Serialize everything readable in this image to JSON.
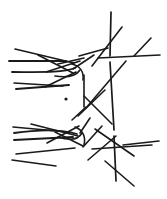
{
  "figure": {
    "canvas": {
      "width": 167,
      "height": 199,
      "background": "#ffffff"
    },
    "ink_color": "#1a1a1a",
    "default_stroke_width": 1.6
  },
  "chart_data": {
    "type": "scatter",
    "xlabel": "",
    "ylabel": "",
    "xlim": [
      0,
      167
    ],
    "ylim": [
      0,
      199
    ],
    "grid": false,
    "legend": "none",
    "annotations": [
      {
        "name": "isolated-dot",
        "x": 66,
        "y": 99,
        "radius": 1.6
      }
    ],
    "segments": [
      {
        "id": "s01",
        "group": "upper-left-fan",
        "x1": 15,
        "y1": 49,
        "x2": 74,
        "y2": 63,
        "width": 1.6
      },
      {
        "id": "s02",
        "group": "upper-left-fan",
        "x1": 9,
        "y1": 61,
        "x2": 66,
        "y2": 61,
        "width": 1.9
      },
      {
        "id": "s03",
        "group": "upper-left-fan",
        "x1": 38,
        "y1": 55,
        "x2": 73,
        "y2": 73,
        "width": 1.6
      },
      {
        "id": "s04",
        "group": "upper-left-fan",
        "x1": 46,
        "y1": 72,
        "x2": 80,
        "y2": 61,
        "width": 1.6
      },
      {
        "id": "s05",
        "group": "upper-left-fan",
        "x1": 58,
        "y1": 64,
        "x2": 84,
        "y2": 58,
        "width": 1.6
      },
      {
        "id": "s06",
        "group": "upper-left-fan",
        "x1": 14,
        "y1": 83,
        "x2": 63,
        "y2": 86,
        "width": 1.6
      },
      {
        "id": "s07",
        "group": "upper-left-fan",
        "x1": 16,
        "y1": 89,
        "x2": 69,
        "y2": 85,
        "width": 1.9
      },
      {
        "id": "s08",
        "group": "upper-left-fan",
        "x1": 45,
        "y1": 87,
        "x2": 76,
        "y2": 72,
        "width": 1.6
      },
      {
        "id": "s09",
        "group": "upper-mid",
        "x1": 73,
        "y1": 69,
        "x2": 94,
        "y2": 55,
        "width": 1.6
      },
      {
        "id": "s10",
        "group": "upper-mid",
        "x1": 79,
        "y1": 56,
        "x2": 108,
        "y2": 48,
        "width": 1.6
      },
      {
        "id": "s11",
        "group": "upper-mid",
        "x1": 84,
        "y1": 75,
        "x2": 84,
        "y2": 107,
        "width": 1.6
      },
      {
        "id": "s12",
        "group": "right-vertical",
        "x1": 111,
        "y1": 12,
        "x2": 110,
        "y2": 56,
        "width": 1.7
      },
      {
        "id": "s13",
        "group": "right-vertical",
        "x1": 110,
        "y1": 62,
        "x2": 114,
        "y2": 130,
        "width": 1.7
      },
      {
        "id": "s14",
        "group": "right-vertical",
        "x1": 114,
        "y1": 136,
        "x2": 116,
        "y2": 181,
        "width": 1.7
      },
      {
        "id": "s15",
        "group": "upper-right-diag",
        "x1": 92,
        "y1": 66,
        "x2": 122,
        "y2": 27,
        "width": 1.6
      },
      {
        "id": "s16",
        "group": "upper-right-diag",
        "x1": 134,
        "y1": 56,
        "x2": 151,
        "y2": 38,
        "width": 1.6
      },
      {
        "id": "s17",
        "group": "upper-right-horiz",
        "x1": 98,
        "y1": 58,
        "x2": 160,
        "y2": 55,
        "width": 1.6
      },
      {
        "id": "s18",
        "group": "centre-diag",
        "x1": 86,
        "y1": 108,
        "x2": 126,
        "y2": 61,
        "width": 1.6
      },
      {
        "id": "s19",
        "group": "centre-diag",
        "x1": 78,
        "y1": 116,
        "x2": 105,
        "y2": 90,
        "width": 1.6
      },
      {
        "id": "s20",
        "group": "centre-diag",
        "x1": 84,
        "y1": 96,
        "x2": 112,
        "y2": 124,
        "width": 1.6
      },
      {
        "id": "s21",
        "group": "lower-left-fan",
        "x1": 13,
        "y1": 127,
        "x2": 68,
        "y2": 132,
        "width": 1.6
      },
      {
        "id": "s22",
        "group": "lower-left-fan",
        "x1": 31,
        "y1": 124,
        "x2": 78,
        "y2": 136,
        "width": 1.6
      },
      {
        "id": "s23",
        "group": "lower-left-fan",
        "x1": 14,
        "y1": 140,
        "x2": 73,
        "y2": 137,
        "width": 1.9
      },
      {
        "id": "s24",
        "group": "lower-left-fan",
        "x1": 47,
        "y1": 143,
        "x2": 79,
        "y2": 126,
        "width": 1.6
      },
      {
        "id": "s25",
        "group": "lower-left-fan",
        "x1": 55,
        "y1": 132,
        "x2": 83,
        "y2": 146,
        "width": 1.6
      },
      {
        "id": "s26",
        "group": "lower-left-fan",
        "x1": 16,
        "y1": 154,
        "x2": 75,
        "y2": 148,
        "width": 1.6
      },
      {
        "id": "s27",
        "group": "lower-left-fan",
        "x1": 12,
        "y1": 160,
        "x2": 56,
        "y2": 166,
        "width": 1.6
      },
      {
        "id": "s28",
        "group": "lower-mid",
        "x1": 72,
        "y1": 120,
        "x2": 86,
        "y2": 107,
        "width": 1.6
      },
      {
        "id": "s29",
        "group": "lower-mid",
        "x1": 80,
        "y1": 133,
        "x2": 90,
        "y2": 118,
        "width": 1.6
      },
      {
        "id": "s30",
        "group": "lower-mid",
        "x1": 83,
        "y1": 147,
        "x2": 102,
        "y2": 126,
        "width": 1.6
      },
      {
        "id": "s31",
        "group": "lower-right",
        "x1": 95,
        "y1": 129,
        "x2": 134,
        "y2": 156,
        "width": 1.6
      },
      {
        "id": "s32",
        "group": "lower-right",
        "x1": 92,
        "y1": 149,
        "x2": 152,
        "y2": 145,
        "width": 1.6
      },
      {
        "id": "s33",
        "group": "lower-right",
        "x1": 123,
        "y1": 145,
        "x2": 159,
        "y2": 141,
        "width": 1.6
      },
      {
        "id": "s34",
        "group": "lower-right",
        "x1": 105,
        "y1": 161,
        "x2": 134,
        "y2": 186,
        "width": 1.6
      },
      {
        "id": "s35",
        "group": "lower-right",
        "x1": 88,
        "y1": 160,
        "x2": 116,
        "y2": 136,
        "width": 1.6
      }
    ],
    "curves": [
      {
        "id": "c01",
        "group": "upper-left-fan",
        "d": "M 12 72 C 40 72 62 73 75 68",
        "width": 1.8
      },
      {
        "id": "c02",
        "group": "upper-left-fan",
        "d": "M 55 76 C 68 78 76 76 80 70",
        "width": 1.6
      },
      {
        "id": "c03",
        "group": "upper-left-fan",
        "d": "M 72 64 C 80 66 84 72 83 80",
        "width": 1.6
      },
      {
        "id": "c04",
        "group": "lower-left-fan",
        "d": "M 14 133 C 42 129 64 130 77 134",
        "width": 1.8
      },
      {
        "id": "c05",
        "group": "lower-left-fan",
        "d": "M 58 137 C 70 141 78 140 82 133",
        "width": 1.6
      },
      {
        "id": "c06",
        "group": "lower-left-fan",
        "d": "M 75 127 C 83 130 86 137 84 145",
        "width": 1.6
      }
    ]
  }
}
